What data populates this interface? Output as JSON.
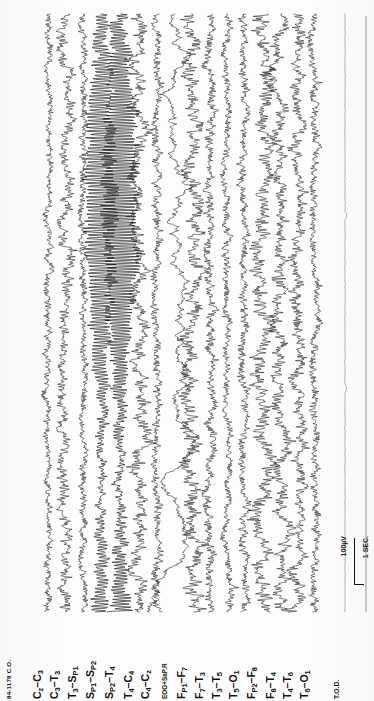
{
  "recording": {
    "id_label": "84-1178 C.O.",
    "footer_label": "T.O.D.",
    "calibration": {
      "amplitude_label": "100µV",
      "time_label": "1 SEC."
    }
  },
  "channels": [
    {
      "name": "Cz-C3",
      "label_html": "C<sub>z</sub>–C<sub>3</sub>",
      "x": 48,
      "amp": 5.5,
      "style": "low",
      "freq": 2.3
    },
    {
      "name": "C3-T3",
      "label_html": "C<sub>3</sub>–T<sub>3</sub>",
      "x": 65,
      "amp": 8.0,
      "style": "mixed",
      "freq": 2.1
    },
    {
      "name": "T3-Sp1",
      "label_html": "T<sub>3</sub>–S<sub>P1</sub>",
      "x": 83,
      "amp": 6.0,
      "style": "low",
      "freq": 2.6
    },
    {
      "name": "Sp1-Sp2",
      "label_html": "S<sub>P1</sub>–S<sub>P2</sub>",
      "x": 101,
      "amp": 15.0,
      "style": "rhythm",
      "freq": 3.4
    },
    {
      "name": "Sp2-T4",
      "label_html": "S<sub>P2</sub>–T<sub>4</sub>",
      "x": 120,
      "amp": 17.5,
      "style": "rhythm",
      "freq": 3.8
    },
    {
      "name": "T4-C4",
      "label_html": "T<sub>4</sub>–C<sub>4</sub>",
      "x": 139,
      "amp": 10.0,
      "style": "mixed",
      "freq": 2.4
    },
    {
      "name": "C4-Cz",
      "label_html": "C<sub>4</sub>–C<sub>z</sub>",
      "x": 156,
      "amp": 7.0,
      "style": "low",
      "freq": 2.2
    },
    {
      "name": "EOG+SaP.R",
      "label_html": "EOG+SaP.R",
      "x": 173,
      "amp": 9.0,
      "style": "eog",
      "freq": 1.4
    },
    {
      "name": "Fp1-F7",
      "label_html": "F<sub>P1</sub>–F<sub>7</sub>",
      "x": 192,
      "amp": 11.0,
      "style": "mixed",
      "freq": 2.0
    },
    {
      "name": "F7-T3",
      "label_html": "F<sub>7</sub>–T<sub>3</sub>",
      "x": 210,
      "amp": 7.5,
      "style": "low",
      "freq": 2.5
    },
    {
      "name": "T3-T5",
      "label_html": "T<sub>3</sub>–T<sub>5</sub>",
      "x": 227,
      "amp": 6.0,
      "style": "low",
      "freq": 2.7
    },
    {
      "name": "T5-O1",
      "label_html": "T<sub>5</sub>–O<sub>1</sub>",
      "x": 244,
      "amp": 7.0,
      "style": "low",
      "freq": 2.4
    },
    {
      "name": "Fp2-F8",
      "label_html": "F<sub>P2</sub>–F<sub>8</sub>",
      "x": 262,
      "amp": 11.5,
      "style": "mixed",
      "freq": 1.9
    },
    {
      "name": "F8-T4",
      "label_html": "F<sub>8</sub>–T<sub>4</sub>",
      "x": 281,
      "amp": 9.5,
      "style": "mixed",
      "freq": 2.2
    },
    {
      "name": "T4-T6",
      "label_html": "T<sub>4</sub>–T<sub>6</sub>",
      "x": 298,
      "amp": 8.5,
      "style": "mixed",
      "freq": 2.3
    },
    {
      "name": "T6-O1",
      "label_html": "T<sub>6</sub>–O<sub>1</sub>",
      "x": 315,
      "amp": 6.5,
      "style": "low",
      "freq": 2.6
    },
    {
      "name": "T.O.D.",
      "label_html": "T.O.D.",
      "x": 345,
      "amp": 0.8,
      "style": "flat",
      "freq": 1.0
    }
  ],
  "chart_data": {
    "type": "line",
    "title": "84-1178 C.O.",
    "xlabel": "Time (rotated: vertical axis, 1 SEC. per calibration mark)",
    "ylabel": "Amplitude per channel (100µV calibration)",
    "orientation": "vertical-traces-rotated-90",
    "n_channels": 17,
    "grid": false,
    "legend": "none",
    "montage": "bipolar longitudinal + sphenoidal (Sp1/Sp2)",
    "calibration_amplitude_uv": 100,
    "calibration_time_sec": 1,
    "series": [
      {
        "name": "Cz-C3",
        "relative_amplitude": 5.5,
        "character": "low-voltage fast"
      },
      {
        "name": "C3-T3",
        "relative_amplitude": 8.0,
        "character": "mixed frequency"
      },
      {
        "name": "T3-Sp1",
        "relative_amplitude": 6.0,
        "character": "low-voltage fast"
      },
      {
        "name": "Sp1-Sp2",
        "relative_amplitude": 15.0,
        "character": "high-amplitude rhythmic discharge"
      },
      {
        "name": "Sp2-T4",
        "relative_amplitude": 17.5,
        "character": "high-amplitude rhythmic discharge (maximal)"
      },
      {
        "name": "T4-C4",
        "relative_amplitude": 10.0,
        "character": "mixed frequency"
      },
      {
        "name": "C4-Cz",
        "relative_amplitude": 7.0,
        "character": "low-voltage fast"
      },
      {
        "name": "EOG+SaP.R",
        "relative_amplitude": 9.0,
        "character": "slow eye-movement artifact with large late deflection"
      },
      {
        "name": "Fp1-F7",
        "relative_amplitude": 11.0,
        "character": "mixed frequency"
      },
      {
        "name": "F7-T3",
        "relative_amplitude": 7.5,
        "character": "low-voltage fast"
      },
      {
        "name": "T3-T5",
        "relative_amplitude": 6.0,
        "character": "low-voltage fast"
      },
      {
        "name": "T5-O1",
        "relative_amplitude": 7.0,
        "character": "low-voltage fast"
      },
      {
        "name": "Fp2-F8",
        "relative_amplitude": 11.5,
        "character": "mixed frequency"
      },
      {
        "name": "F8-T4",
        "relative_amplitude": 9.5,
        "character": "mixed frequency"
      },
      {
        "name": "T4-T6",
        "relative_amplitude": 8.5,
        "character": "mixed frequency"
      },
      {
        "name": "T6-O1",
        "relative_amplitude": 6.5,
        "character": "low-voltage fast"
      },
      {
        "name": "T.O.D.",
        "relative_amplitude": 0.8,
        "character": "near-isoelectric reference line"
      }
    ]
  }
}
